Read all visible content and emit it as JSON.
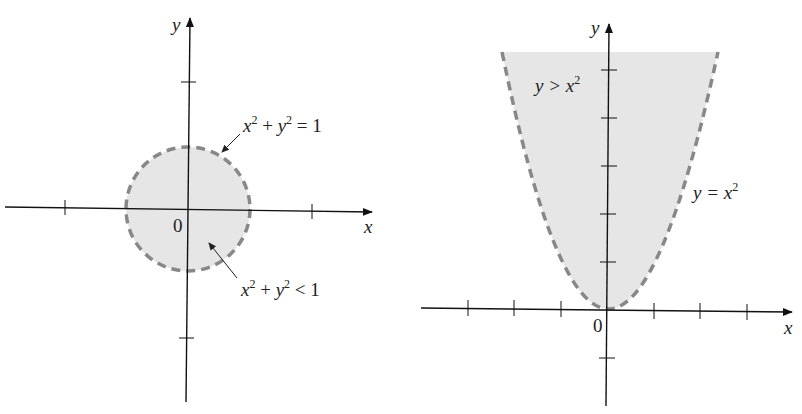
{
  "figures": [
    {
      "id": "left",
      "description": "Unit disk (open) bounded by dashed circle",
      "axes": {
        "x_label": "x",
        "y_label": "y",
        "origin_label": "0"
      },
      "boundary": {
        "equation": "x² + y² = 1",
        "style": "dashed"
      },
      "region": {
        "inequality": "x² + y² < 1",
        "fill": "#e6e6e6"
      },
      "labels": {
        "boundary_base1": "x",
        "boundary_exp1": "2",
        "boundary_plus": " + ",
        "boundary_base2": "y",
        "boundary_exp2": "2",
        "boundary_rhs": " = 1",
        "region_base1": "x",
        "region_exp1": "2",
        "region_plus": " + ",
        "region_base2": "y",
        "region_exp2": "2",
        "region_rhs": " < 1"
      }
    },
    {
      "id": "right",
      "description": "Region above parabola y = x² (open), boundary dashed",
      "axes": {
        "x_label": "x",
        "y_label": "y",
        "origin_label": "0"
      },
      "boundary": {
        "equation": "y = x²",
        "style": "dashed"
      },
      "region": {
        "inequality": "y > x²",
        "fill": "#e6e6e6"
      },
      "labels": {
        "region_lhs": "y > ",
        "region_base": "x",
        "region_exp": "2",
        "boundary_lhs": "y = ",
        "boundary_base": "x",
        "boundary_exp": "2"
      }
    }
  ],
  "colors": {
    "axis": "#111111",
    "fill": "#e6e6e6",
    "dash": "#888888"
  }
}
